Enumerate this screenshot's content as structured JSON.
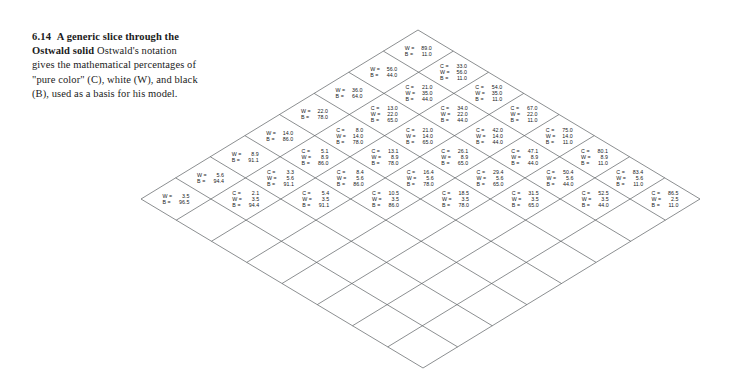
{
  "figure": {
    "number": "6.14",
    "title": "A generic slice through the Ostwald solid",
    "body": "Ostwald's notation gives the mathematical percentages of \"pure color\" (C), white (W), and black (B), used as a basis for his model.",
    "caption_full": "6.14  A generic slice through the Ostwald solid Ostwald's notation gives the mathematical percentages of \"pure color\" (C), white (W), and black (B), used as a basis for his model."
  },
  "keys": {
    "c": "C",
    "w": "W",
    "b": "B",
    "eq": "="
  },
  "colors": {
    "background": "#ffffff",
    "line": "#5a5e62",
    "text": "#16181a",
    "caption": "#1b1b1b"
  },
  "grid": {
    "rows": 8,
    "cols": 8,
    "top_vertex": [
      418,
      30
    ],
    "left_vertex": [
      141,
      199
    ],
    "right_vertex": [
      700,
      199
    ],
    "bottom_vertex": [
      418,
      368
    ],
    "labelled_region": "right-hand triangular half",
    "empty_region": "left-hand triangular half"
  },
  "chart_data": {
    "type": "diagram",
    "title": "A generic slice through the Ostwald solid",
    "cells": [
      {
        "row": 0,
        "col": 0,
        "C": null,
        "W": 89.0,
        "B": 11.0
      },
      {
        "row": 1,
        "col": 0,
        "C": null,
        "W": 56.0,
        "B": 44.0
      },
      {
        "row": 2,
        "col": 0,
        "C": null,
        "W": 36.0,
        "B": 64.0
      },
      {
        "row": 3,
        "col": 0,
        "C": null,
        "W": 22.0,
        "B": 78.0
      },
      {
        "row": 4,
        "col": 0,
        "C": null,
        "W": 14.0,
        "B": 86.0
      },
      {
        "row": 5,
        "col": 0,
        "C": null,
        "W": 8.9,
        "B": 91.1
      },
      {
        "row": 6,
        "col": 0,
        "C": null,
        "W": 5.6,
        "B": 94.4
      },
      {
        "row": 7,
        "col": 0,
        "C": null,
        "W": 3.5,
        "B": 96.5
      },
      {
        "row": 0,
        "col": 1,
        "C": 33.0,
        "W": 56.0,
        "B": 11.0
      },
      {
        "row": 1,
        "col": 1,
        "C": 21.0,
        "W": 35.0,
        "B": 44.0
      },
      {
        "row": 2,
        "col": 1,
        "C": 13.0,
        "W": 22.0,
        "B": 65.0
      },
      {
        "row": 3,
        "col": 1,
        "C": 8.0,
        "W": 14.0,
        "B": 78.0
      },
      {
        "row": 4,
        "col": 1,
        "C": 5.1,
        "W": 8.9,
        "B": 86.0
      },
      {
        "row": 5,
        "col": 1,
        "C": 3.3,
        "W": 5.6,
        "B": 91.1
      },
      {
        "row": 6,
        "col": 1,
        "C": 2.1,
        "W": 3.5,
        "B": 94.4
      },
      {
        "row": 0,
        "col": 2,
        "C": 54.0,
        "W": 35.0,
        "B": 11.0
      },
      {
        "row": 1,
        "col": 2,
        "C": 34.0,
        "W": 22.0,
        "B": 44.0
      },
      {
        "row": 2,
        "col": 2,
        "C": 21.0,
        "W": 14.0,
        "B": 65.0
      },
      {
        "row": 3,
        "col": 2,
        "C": 13.1,
        "W": 8.9,
        "B": 78.0
      },
      {
        "row": 4,
        "col": 2,
        "C": 8.4,
        "W": 5.6,
        "B": 86.0
      },
      {
        "row": 5,
        "col": 2,
        "C": 5.4,
        "W": 3.5,
        "B": 91.1
      },
      {
        "row": 0,
        "col": 3,
        "C": 67.0,
        "W": 22.0,
        "B": 11.0
      },
      {
        "row": 1,
        "col": 3,
        "C": 42.0,
        "W": 14.0,
        "B": 44.0
      },
      {
        "row": 2,
        "col": 3,
        "C": 26.1,
        "W": 8.9,
        "B": 65.0
      },
      {
        "row": 3,
        "col": 3,
        "C": 16.4,
        "W": 5.6,
        "B": 78.0
      },
      {
        "row": 4,
        "col": 3,
        "C": 10.5,
        "W": 3.5,
        "B": 86.0
      },
      {
        "row": 0,
        "col": 4,
        "C": 75.0,
        "W": 14.0,
        "B": 11.0
      },
      {
        "row": 1,
        "col": 4,
        "C": 47.1,
        "W": 8.9,
        "B": 44.0
      },
      {
        "row": 2,
        "col": 4,
        "C": 29.4,
        "W": 5.6,
        "B": 65.0
      },
      {
        "row": 3,
        "col": 4,
        "C": 18.5,
        "W": 3.5,
        "B": 78.0
      },
      {
        "row": 0,
        "col": 5,
        "C": 80.1,
        "W": 8.9,
        "B": 11.0
      },
      {
        "row": 1,
        "col": 5,
        "C": 50.4,
        "W": 5.6,
        "B": 44.0
      },
      {
        "row": 2,
        "col": 5,
        "C": 31.5,
        "W": 3.5,
        "B": 65.0
      },
      {
        "row": 0,
        "col": 6,
        "C": 83.4,
        "W": 5.6,
        "B": 11.0
      },
      {
        "row": 1,
        "col": 6,
        "C": 52.5,
        "W": 3.5,
        "B": 44.0
      },
      {
        "row": 0,
        "col": 7,
        "C": 86.5,
        "W": 2.5,
        "B": 11.0
      }
    ]
  }
}
